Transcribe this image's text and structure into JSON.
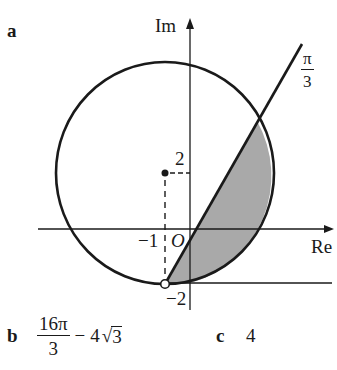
{
  "parts": {
    "a": {
      "label": "a"
    },
    "b": {
      "label": "b",
      "answer": {
        "frac_num": "16π",
        "frac_den": "3",
        "minus": "−",
        "coef": "4",
        "radical": "√",
        "radicand": "3"
      }
    },
    "c": {
      "label": "c",
      "answer": "4"
    }
  },
  "diagram": {
    "axes": {
      "x_label": "Re",
      "y_label": "Im"
    },
    "tick_labels": {
      "x_neg1": "−1",
      "origin": "O",
      "y_2": "2",
      "y_neg2": "−2"
    },
    "ray_angle_label": {
      "num": "π",
      "den": "3"
    },
    "circle": {
      "center": [
        -1,
        2
      ],
      "radius_units": 4
    },
    "shading_color": "#a9a9a9",
    "stroke_color": "#1a1a1a"
  }
}
